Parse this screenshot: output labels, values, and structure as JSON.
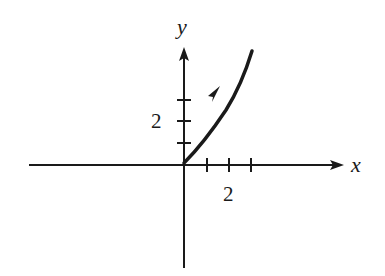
{
  "diagram": {
    "type": "parametric-curve-plot",
    "colors": {
      "ink": "#1a1a1a",
      "background": "#ffffff"
    },
    "axes": {
      "x_label": "x",
      "y_label": "y",
      "x_tick_label": "2",
      "y_tick_label": "2",
      "x_ticks": [
        1,
        2,
        3
      ],
      "y_ticks": [
        1,
        2,
        3
      ]
    },
    "curve": {
      "description": "Curve starting at origin rising to the upper right with a direction arrow",
      "start": [
        0,
        0
      ],
      "end": [
        3.1,
        5.4
      ],
      "has_direction_arrow": true
    }
  }
}
